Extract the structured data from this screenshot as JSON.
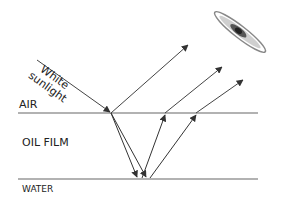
{
  "diagram": {
    "labels": {
      "air": "AIR",
      "oil_film": "OIL FILM",
      "water": "WATER",
      "incident_line1": "White",
      "incident_line2": "sunlight"
    },
    "colors": {
      "line": "#555555",
      "arrow": "#333333",
      "text": "#222222",
      "eye": "#444444"
    },
    "interfaces": [
      {
        "name": "air-oil",
        "y": 113
      },
      {
        "name": "oil-water",
        "y": 179
      }
    ],
    "rays": [
      {
        "name": "incident",
        "from": [
          37,
          60
        ],
        "to": [
          111,
          113
        ]
      },
      {
        "name": "reflected-top",
        "from": [
          111,
          113
        ],
        "to": [
          188,
          45
        ]
      },
      {
        "name": "refracted-down-1",
        "from": [
          111,
          113
        ],
        "to": [
          137,
          177
        ]
      },
      {
        "name": "refracted-down-2",
        "from": [
          111,
          113
        ],
        "to": [
          146,
          177
        ]
      },
      {
        "name": "reflected-up-1",
        "from": [
          142,
          178
        ],
        "to": [
          165,
          114
        ]
      },
      {
        "name": "emerging-1",
        "from": [
          165,
          113
        ],
        "to": [
          222,
          67
        ]
      },
      {
        "name": "reflected-up-2",
        "from": [
          150,
          178
        ],
        "to": [
          196,
          114
        ]
      },
      {
        "name": "emerging-2",
        "from": [
          196,
          113
        ],
        "to": [
          243,
          80
        ]
      }
    ]
  }
}
